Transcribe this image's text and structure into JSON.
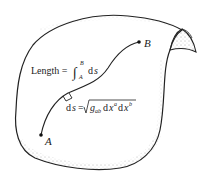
{
  "diagram": {
    "type": "curved-surface-with-path",
    "points": {
      "start": {
        "label": "A",
        "x": 41,
        "y": 135
      },
      "end": {
        "label": "B",
        "x": 139,
        "y": 42
      }
    },
    "length_formula": {
      "prefix": "Length =",
      "integral_upper": "B",
      "integral_lower": "A",
      "integrand": "ds"
    },
    "line_element_formula": {
      "lhs": "ds =",
      "rhs": "g_ab dx^a dx^b",
      "g": "g",
      "g_sub": "ab",
      "dx1": "dx",
      "sup1": "a",
      "dx2": "dx",
      "sup2": "b"
    },
    "colors": {
      "ink": "#222222",
      "background": "#ffffff"
    }
  }
}
